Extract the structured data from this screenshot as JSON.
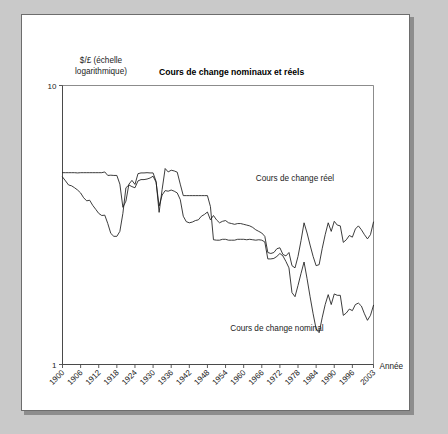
{
  "figure": {
    "y_axis_caption_line1": "$/£ (échelle",
    "y_axis_caption_line2": "logarithmique)",
    "x_axis_name": "Année"
  },
  "chart_data": {
    "type": "line",
    "title": "Cours de change nominaux et réels",
    "xlabel": "Année",
    "ylabel": "$/£ (échelle logarithmique)",
    "yscale": "log",
    "ylim": [
      1,
      10
    ],
    "ytick_labels": [
      "1",
      "10"
    ],
    "ytick_values": [
      1,
      10
    ],
    "xlim": [
      1900,
      2003
    ],
    "grid": false,
    "legend": "inline-annotations",
    "annotations": [
      {
        "text": "Cours de change réel",
        "x": 1977,
        "y": 4.55
      },
      {
        "text": "Cours de change nominal",
        "x": 1971,
        "y": 1.32
      }
    ],
    "xtick_labels": [
      "1900",
      "1906",
      "1912",
      "1918",
      "1924",
      "1930",
      "1936",
      "1942",
      "1948",
      "1954",
      "1960",
      "1966",
      "1972",
      "1978",
      "1984",
      "1990",
      "1996",
      "2003"
    ],
    "xtick_values": [
      1900,
      1906,
      1912,
      1918,
      1924,
      1930,
      1936,
      1942,
      1948,
      1954,
      1960,
      1966,
      1972,
      1978,
      1984,
      1990,
      1996,
      2003
    ],
    "x": [
      1900,
      1901,
      1902,
      1903,
      1904,
      1905,
      1906,
      1907,
      1908,
      1909,
      1910,
      1911,
      1912,
      1913,
      1914,
      1915,
      1916,
      1917,
      1918,
      1919,
      1920,
      1921,
      1922,
      1923,
      1924,
      1925,
      1926,
      1927,
      1928,
      1929,
      1930,
      1931,
      1932,
      1933,
      1934,
      1935,
      1936,
      1937,
      1938,
      1939,
      1940,
      1941,
      1942,
      1943,
      1944,
      1945,
      1946,
      1947,
      1948,
      1949,
      1950,
      1951,
      1952,
      1953,
      1954,
      1955,
      1956,
      1957,
      1958,
      1959,
      1960,
      1961,
      1962,
      1963,
      1964,
      1965,
      1966,
      1967,
      1968,
      1969,
      1970,
      1971,
      1972,
      1973,
      1974,
      1975,
      1976,
      1977,
      1978,
      1979,
      1980,
      1981,
      1982,
      1983,
      1984,
      1985,
      1986,
      1987,
      1988,
      1989,
      1990,
      1991,
      1992,
      1993,
      1994,
      1995,
      1996,
      1997,
      1998,
      1999,
      2000,
      2001,
      2002,
      2003
    ],
    "series": [
      {
        "name": "Cours de change nominal",
        "values": [
          4.87,
          4.87,
          4.87,
          4.87,
          4.87,
          4.86,
          4.87,
          4.87,
          4.87,
          4.87,
          4.87,
          4.87,
          4.87,
          4.87,
          4.9,
          4.76,
          4.77,
          4.76,
          4.76,
          4.43,
          3.66,
          3.85,
          4.43,
          4.57,
          4.42,
          4.83,
          4.86,
          4.86,
          4.87,
          4.86,
          4.86,
          4.53,
          3.51,
          4.24,
          5.04,
          4.9,
          4.97,
          4.94,
          4.89,
          4.43,
          4.03,
          4.03,
          4.03,
          4.03,
          4.03,
          4.03,
          4.03,
          4.03,
          4.03,
          3.68,
          2.8,
          2.79,
          2.79,
          2.81,
          2.81,
          2.79,
          2.79,
          2.79,
          2.81,
          2.81,
          2.81,
          2.8,
          2.81,
          2.8,
          2.79,
          2.8,
          2.79,
          2.75,
          2.39,
          2.39,
          2.4,
          2.44,
          2.5,
          2.45,
          2.34,
          2.22,
          1.81,
          1.75,
          1.92,
          2.12,
          2.33,
          2.03,
          1.75,
          1.52,
          1.34,
          1.3,
          1.47,
          1.64,
          1.78,
          1.64,
          1.79,
          1.77,
          1.77,
          1.5,
          1.53,
          1.58,
          1.56,
          1.64,
          1.66,
          1.62,
          1.52,
          1.44,
          1.5,
          1.63
        ]
      },
      {
        "name": "Cours de change réel",
        "values": [
          4.7,
          4.55,
          4.4,
          4.37,
          4.3,
          4.22,
          4.12,
          3.96,
          3.86,
          3.88,
          3.72,
          3.6,
          3.48,
          3.42,
          3.43,
          3.2,
          2.95,
          2.88,
          2.88,
          3.0,
          3.48,
          4.3,
          4.4,
          4.34,
          4.3,
          4.55,
          4.6,
          4.6,
          4.62,
          4.66,
          4.73,
          4.5,
          3.7,
          4.05,
          4.2,
          4.18,
          4.22,
          4.18,
          4.12,
          3.9,
          3.4,
          3.25,
          3.22,
          3.24,
          3.28,
          3.3,
          3.4,
          3.45,
          3.52,
          3.3,
          3.42,
          3.3,
          3.22,
          3.26,
          3.28,
          3.22,
          3.2,
          3.18,
          3.2,
          3.2,
          3.18,
          3.16,
          3.14,
          3.1,
          3.04,
          3.0,
          2.96,
          2.88,
          2.52,
          2.5,
          2.52,
          2.6,
          2.62,
          2.48,
          2.45,
          2.52,
          2.26,
          2.22,
          2.44,
          2.78,
          3.22,
          2.96,
          2.68,
          2.44,
          2.26,
          2.28,
          2.6,
          2.92,
          3.22,
          3.0,
          3.26,
          3.16,
          3.14,
          2.74,
          2.8,
          2.9,
          2.86,
          3.06,
          3.14,
          3.04,
          2.92,
          2.82,
          2.92,
          3.24
        ]
      }
    ]
  }
}
